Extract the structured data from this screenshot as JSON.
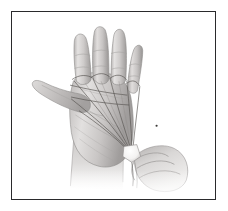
{
  "image": {
    "title": "String Figure Hand Illustration",
    "medium": "pencil-sketch",
    "orientation": "portrait",
    "width": 228,
    "height": 211,
    "background_color": "#ffffff"
  },
  "frame": {
    "name": "image-border",
    "border_color": "#2a2a2c",
    "border_width": 1.4,
    "x": 11,
    "y": 11,
    "width": 205,
    "height": 189,
    "fill": "#ffffff"
  },
  "subject": {
    "description": "An open left hand seen palm-forward with four fingers extended upward and the thumb extended to the left; multiple thin strings loop around the finger bases and converge downward to a knot held by a second hand entering from the lower right.",
    "parts": [
      {
        "name": "index-finger",
        "label": "Index finger"
      },
      {
        "name": "middle-finger",
        "label": "Middle finger"
      },
      {
        "name": "ring-finger",
        "label": "Ring finger"
      },
      {
        "name": "little-finger",
        "label": "Little finger"
      },
      {
        "name": "thumb",
        "label": "Thumb"
      },
      {
        "name": "palm",
        "label": "Palm"
      },
      {
        "name": "wrist",
        "label": "Wrist"
      },
      {
        "name": "second-hand",
        "label": "Second hand"
      },
      {
        "name": "string-bundle",
        "label": "String bundle"
      },
      {
        "name": "string-knot",
        "label": "String knot"
      }
    ]
  },
  "palette": {
    "skin_light": "#e9e7e6",
    "skin_mid": "#c9c6c5",
    "skin_shade": "#a7a4a3",
    "skin_dark": "#868382",
    "outline": "#6d6a69",
    "string": "#55524f",
    "string_light": "#8b8886",
    "dot": "#3a3836",
    "paper": "#ffffff"
  },
  "marks": {
    "dot": {
      "name": "stray-dot",
      "x": 157,
      "y": 126,
      "radius": 1.1
    }
  }
}
